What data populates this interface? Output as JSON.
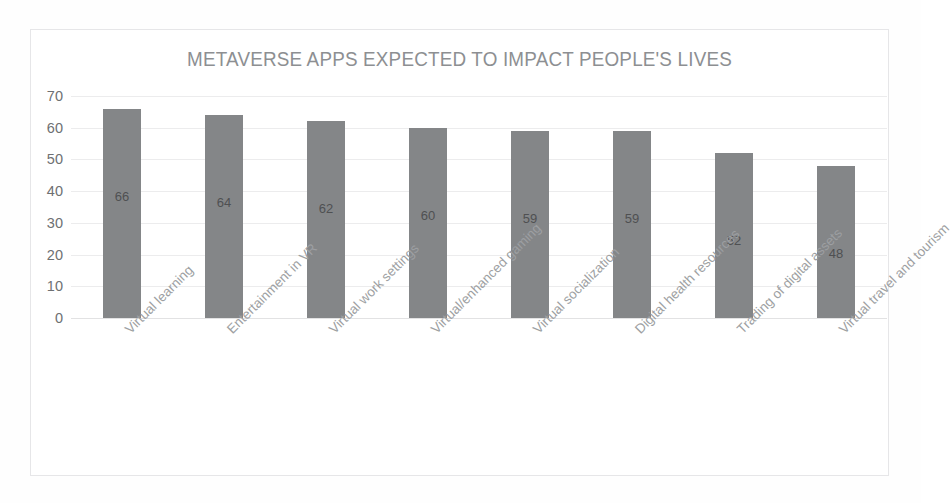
{
  "chart_data": {
    "type": "bar",
    "title": "METAVERSE APPS EXPECTED TO IMPACT PEOPLE'S LIVES",
    "categories": [
      "Virtual learning",
      "Entertainment in VR",
      "Virtual work settings",
      "Virtual/enhanced gaming",
      "Virtual socialization",
      "Digital health resources",
      "Trading of digital assets",
      "Virtual travel and tourism"
    ],
    "values": [
      66,
      64,
      62,
      60,
      59,
      59,
      52,
      48
    ],
    "data_labels": [
      "66",
      "64",
      "62",
      "60",
      "59",
      "59",
      "52",
      "48"
    ],
    "xlabel": "",
    "ylabel": "",
    "ylim": [
      0,
      70
    ],
    "ytick_labels": [
      "70",
      "60",
      "50",
      "40",
      "30",
      "20",
      "10",
      "0"
    ],
    "ytick_values": [
      70,
      60,
      50,
      40,
      30,
      20,
      10,
      0
    ],
    "grid": true,
    "legend": false,
    "bar_color": "#848688",
    "title_color": "#8d8f92",
    "gridline_color": "#ececed",
    "category_label_color": "#9d9fa2",
    "axis_label_color": "#6e7072",
    "background_color": "#ffffff"
  }
}
